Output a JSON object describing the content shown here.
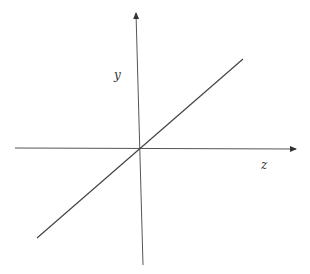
{
  "diagram": {
    "axes": {
      "vertical_label": "y",
      "horizontal_label": "z"
    },
    "line_color": "#444444",
    "elements": [
      {
        "type": "axis",
        "name": "vertical-axis",
        "from": [
          143,
          265
        ],
        "to": [
          136,
          12
        ],
        "arrow": "end"
      },
      {
        "type": "axis",
        "name": "horizontal-axis",
        "from": [
          15,
          148
        ],
        "to": [
          297,
          149
        ],
        "arrow": "end"
      },
      {
        "type": "line",
        "name": "diagonal-line",
        "from": [
          37,
          238
        ],
        "to": [
          243,
          59
        ]
      }
    ]
  }
}
